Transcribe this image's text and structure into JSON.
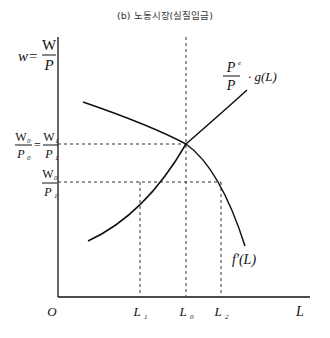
{
  "title": "(b) 노동시장(실질임금)",
  "axes": {
    "y_label_lhs": "w=",
    "y_label_num": "W",
    "y_label_den": "P",
    "x_label": "L",
    "origin": "O"
  },
  "y_ticks": {
    "upper_lhs_num": "W",
    "upper_lhs_num_sub": "0",
    "upper_lhs_den": "P",
    "upper_lhs_den_sub": "0",
    "upper_eq": "=",
    "upper_rhs_num": "W",
    "upper_rhs_num_sub": "1",
    "upper_rhs_den": "P",
    "upper_rhs_den_sub": "1",
    "lower_num": "W",
    "lower_num_sub": "0",
    "lower_den": "P",
    "lower_den_sub": "1"
  },
  "x_ticks": [
    {
      "main": "L",
      "sub": "1"
    },
    {
      "main": "L",
      "sub": "0"
    },
    {
      "main": "L",
      "sub": "2"
    }
  ],
  "curves": {
    "supply_num": "P",
    "supply_num_sup": "e",
    "supply_den": "P",
    "supply_rest": "· g(L)",
    "demand": "f′(L)"
  }
}
